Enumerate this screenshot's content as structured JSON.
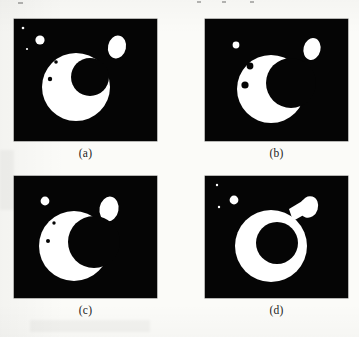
{
  "figure": {
    "kind": "binary-image-panel-grid",
    "rows": 2,
    "columns": 2,
    "background_color": "#fbfbf8",
    "panel_background_color": "#050505",
    "foreground_color": "#ffffff",
    "panels": [
      {
        "id": "a",
        "caption": "(a)",
        "canvas": {
          "width": 143,
          "height": 122
        },
        "description": "Large white disc with an off-centre black circular hole, a detached white ellipse at upper right, a small white disc at upper left, two tiny white specks and two tiny black specks inside the disc",
        "shapes": [
          {
            "name": "speck-white-tiny-1",
            "type": "circle",
            "cx": 9,
            "cy": 9,
            "r": 1.3,
            "fill": "#ffffff"
          },
          {
            "name": "speck-white-tiny-2",
            "type": "circle",
            "cx": 13,
            "cy": 30,
            "r": 1.1,
            "fill": "#ffffff"
          },
          {
            "name": "satellite-disc",
            "type": "circle",
            "cx": 26,
            "cy": 21,
            "r": 4.6,
            "fill": "#ffffff"
          },
          {
            "name": "ellipse-blob",
            "type": "ellipse",
            "cx": 103,
            "cy": 28,
            "rx": 9,
            "ry": 11.5,
            "rot": 12,
            "fill": "#ffffff"
          },
          {
            "name": "main-disc",
            "type": "circle",
            "cx": 62,
            "cy": 68,
            "r": 34,
            "fill": "#ffffff"
          },
          {
            "name": "main-hole",
            "type": "circle",
            "cx": 76,
            "cy": 58,
            "r": 19,
            "fill": "#050505"
          },
          {
            "name": "speck-black-1",
            "type": "circle",
            "cx": 42,
            "cy": 43,
            "r": 1.8,
            "fill": "#050505"
          },
          {
            "name": "speck-black-2",
            "type": "circle",
            "cx": 36,
            "cy": 60,
            "r": 2.2,
            "fill": "#050505"
          }
        ]
      },
      {
        "id": "b",
        "caption": "(b)",
        "canvas": {
          "width": 143,
          "height": 122
        },
        "description": "Crescent (C) opening to the right, detached white ellipse at upper right, one small white disc at upper left, two black specks on the left limb",
        "shapes": [
          {
            "name": "satellite-disc",
            "type": "circle",
            "cx": 31,
            "cy": 26,
            "r": 3.4,
            "fill": "#ffffff"
          },
          {
            "name": "ellipse-blob",
            "type": "ellipse",
            "cx": 107,
            "cy": 30,
            "rx": 8.5,
            "ry": 11,
            "rot": 14,
            "fill": "#ffffff"
          },
          {
            "name": "main-disc",
            "type": "circle",
            "cx": 66,
            "cy": 70,
            "r": 34,
            "fill": "#ffffff"
          },
          {
            "name": "main-hole",
            "type": "circle",
            "cx": 86,
            "cy": 64,
            "r": 25,
            "fill": "#050505"
          },
          {
            "name": "speck-black-1",
            "type": "circle",
            "cx": 45,
            "cy": 47,
            "r": 3.4,
            "fill": "#050505"
          },
          {
            "name": "speck-black-2",
            "type": "circle",
            "cx": 40,
            "cy": 66,
            "r": 3.6,
            "fill": "#050505"
          }
        ]
      },
      {
        "id": "c",
        "caption": "(c)",
        "canvas": {
          "width": 143,
          "height": 122
        },
        "description": "Crescent opening to the right with the white ellipse nearly touching the upper arm tip, one small white disc at upper left, two tiny black specks on the left limb",
        "shapes": [
          {
            "name": "satellite-disc",
            "type": "circle",
            "cx": 31,
            "cy": 25,
            "r": 4.4,
            "fill": "#ffffff"
          },
          {
            "name": "ellipse-blob",
            "type": "ellipse",
            "cx": 95,
            "cy": 33,
            "rx": 9.5,
            "ry": 12.5,
            "rot": 10,
            "fill": "#ffffff"
          },
          {
            "name": "main-disc",
            "type": "circle",
            "cx": 60,
            "cy": 70,
            "r": 35,
            "fill": "#ffffff"
          },
          {
            "name": "main-hole",
            "type": "circle",
            "cx": 80,
            "cy": 66,
            "r": 26,
            "fill": "#050505"
          },
          {
            "name": "speck-black-1",
            "type": "circle",
            "cx": 40,
            "cy": 47,
            "r": 1.7,
            "fill": "#050505"
          },
          {
            "name": "speck-black-2",
            "type": "circle",
            "cx": 34,
            "cy": 65,
            "r": 2.0,
            "fill": "#050505"
          }
        ]
      },
      {
        "id": "d",
        "caption": "(d)",
        "canvas": {
          "width": 143,
          "height": 122
        },
        "description": "Thick white ring (annulus) with a centred black hole, the white ellipse attached to the ring by a narrow neck at upper right, a small white disc and two tiny white specks at upper left",
        "shapes": [
          {
            "name": "speck-white-tiny-1",
            "type": "circle",
            "cx": 12,
            "cy": 9,
            "r": 1.2,
            "fill": "#ffffff"
          },
          {
            "name": "speck-white-tiny-2",
            "type": "circle",
            "cx": 14,
            "cy": 31,
            "r": 1.2,
            "fill": "#ffffff"
          },
          {
            "name": "satellite-disc",
            "type": "circle",
            "cx": 29,
            "cy": 24,
            "r": 4.4,
            "fill": "#ffffff"
          },
          {
            "name": "neck",
            "type": "polygon",
            "points": "84,33 99,24 104,36 88,45",
            "fill": "#ffffff"
          },
          {
            "name": "ellipse-blob",
            "type": "ellipse",
            "cx": 104,
            "cy": 31,
            "rx": 9,
            "ry": 11,
            "rot": 18,
            "fill": "#ffffff"
          },
          {
            "name": "main-disc",
            "type": "circle",
            "cx": 66,
            "cy": 70,
            "r": 36,
            "fill": "#ffffff"
          },
          {
            "name": "main-hole",
            "type": "circle",
            "cx": 72,
            "cy": 67,
            "r": 21,
            "fill": "#050505"
          }
        ]
      }
    ]
  }
}
